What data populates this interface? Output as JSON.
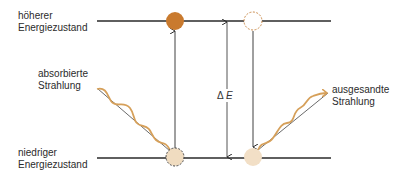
{
  "labels": {
    "upper_state": {
      "line1": "höherer",
      "line2": "Energiezustand"
    },
    "lower_state": {
      "line1": "niedriger",
      "line2": "Energiezustand"
    },
    "absorbed": {
      "line1": "absorbierte",
      "line2": "Strahlung"
    },
    "emitted": {
      "line1": "ausgesandte",
      "line2": "Strahlung"
    },
    "delta_symbol": "Δ",
    "delta_var": "E"
  },
  "colors": {
    "line": "#2a2a2a",
    "filled_particle": "#c97a2e",
    "wave": "#d6a05a",
    "faded_particle": "#f0dcc0",
    "dashed_outline": "#c98a4a"
  }
}
